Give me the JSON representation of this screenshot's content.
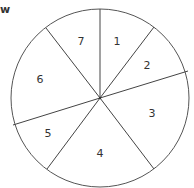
{
  "header": {
    "cut_text": "w"
  },
  "diagram": {
    "type": "divided-circle",
    "center": [
      100,
      98
    ],
    "radius": 89,
    "stroke_color": "#555555",
    "sector_labels": [
      "1",
      "2",
      "3",
      "4",
      "5",
      "6",
      "7"
    ]
  }
}
